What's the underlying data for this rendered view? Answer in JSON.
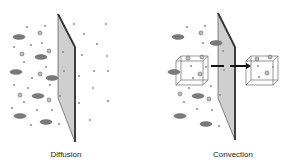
{
  "panels": [
    {
      "id": "diffusion",
      "label": "Diffusion"
    },
    {
      "id": "convection",
      "label": "Convection"
    }
  ],
  "colors": {
    "membrane_face": "#cfcfcf",
    "membrane_edge": "#3a3a3a",
    "large_solute": "#7a7a7a",
    "small_solute": "#8a8a8a",
    "box_stroke": "#555555",
    "arrow": "#111111"
  }
}
